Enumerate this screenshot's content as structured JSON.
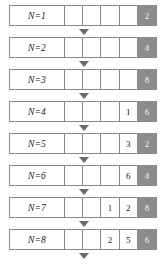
{
  "diagram": {
    "colors": {
      "border": "#8a8a8a",
      "highlight_fill": "#8c8c8c",
      "highlight_text": "#f2f2f2",
      "arrow": "#6b6b6b",
      "background": "#ffffff"
    },
    "column_count": 5,
    "arrow_icon": "triangle-down-icon",
    "rows": [
      {
        "label": "N=1",
        "value": "2",
        "cells": [
          "",
          "",
          "",
          "",
          "2"
        ]
      },
      {
        "label": "N=2",
        "value": "4",
        "cells": [
          "",
          "",
          "",
          "",
          "4"
        ]
      },
      {
        "label": "N=3",
        "value": "8",
        "cells": [
          "",
          "",
          "",
          "",
          "8"
        ]
      },
      {
        "label": "N=4",
        "value": "16",
        "cells": [
          "",
          "",
          "",
          "1",
          "6"
        ]
      },
      {
        "label": "N=5",
        "value": "32",
        "cells": [
          "",
          "",
          "",
          "3",
          "2"
        ]
      },
      {
        "label": "N=6",
        "value": "64",
        "cells": [
          "",
          "",
          "",
          "6",
          "4"
        ]
      },
      {
        "label": "N=7",
        "value": "128",
        "cells": [
          "",
          "",
          "1",
          "2",
          "8"
        ]
      },
      {
        "label": "N=8",
        "value": "256",
        "cells": [
          "",
          "",
          "2",
          "5",
          "6"
        ]
      }
    ]
  }
}
